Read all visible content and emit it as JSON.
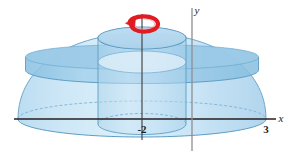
{
  "figure": {
    "name": "solid-of-revolution-washer-diagram",
    "background_color": "#ffffff",
    "width": 296,
    "height": 165
  },
  "axes": {
    "x_axis": {
      "label": "x",
      "label_position": {
        "x": 283,
        "y": 122
      },
      "line": {
        "x1": 14,
        "y1": 119,
        "x2": 276,
        "y2": 119
      },
      "color": "#231f20"
    },
    "y_axis": {
      "label": "y",
      "label_position": {
        "x": 196,
        "y": 13
      },
      "line": {
        "x1": 192,
        "y1": 8,
        "x2": 192,
        "y2": 151
      },
      "color": "#8e8e92"
    },
    "ticks": [
      {
        "label": "-2",
        "x": 142,
        "y": 133,
        "axis": "x"
      },
      {
        "label": "3",
        "x": 266,
        "y": 133,
        "axis": "x"
      }
    ]
  },
  "rotation_axis": {
    "name": "axis-of-revolution",
    "description": "vertical line x = -2",
    "x": 142,
    "y_top": 18,
    "y_bottom": 140,
    "color": "#3b3b3b"
  },
  "rotation_arrow": {
    "name": "rotation-arrow",
    "color": "#e01b22",
    "center": {
      "x": 142,
      "y": 19
    },
    "rx": 15,
    "ry": 5
  },
  "solid": {
    "outer_surface": {
      "name": "outer-paraboloid-dome",
      "fill": "#bcdcf0",
      "stroke": "#6fa8cc",
      "apex": {
        "x": 142,
        "y": 33
      },
      "base_left": {
        "x": 18,
        "y": 119
      },
      "base_right": {
        "x": 266,
        "y": 119
      }
    },
    "inner_cylinder": {
      "name": "inner-cylinder-hole",
      "fill": "#a9d2ea",
      "stroke": "#5f9dc4",
      "cx": 142,
      "rx": 44,
      "ry": 11,
      "top_y": 38,
      "bottom_y": 124
    },
    "washer_slice": {
      "name": "washer-slice-band",
      "fill": "#8fc3e2",
      "stroke": "#5f9dc4",
      "top_y": 57,
      "bottom_y": 70
    },
    "base_ellipse": {
      "name": "base-ellipse",
      "cx": 142,
      "rx": 124,
      "ry": 18,
      "cy": 119,
      "stroke": "#6fa8cc",
      "dash": "3 2"
    }
  },
  "colors": {
    "fill_light": "#cfe6f5",
    "fill_mid": "#aed5ee",
    "fill_dark": "#8dc3e3",
    "outline": "#6ba5ca",
    "accent_red": "#e01b22",
    "axis_grey": "#8e8e92",
    "axis_black": "#231f20"
  }
}
